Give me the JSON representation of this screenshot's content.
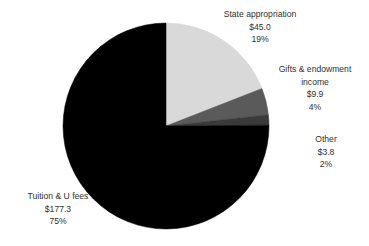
{
  "chart_data": {
    "type": "pie",
    "title": "",
    "subtitle": "",
    "xlabel": "",
    "ylabel": "",
    "legend_position": "none",
    "grid": false,
    "value_prefix": "$",
    "total_value": 236.0,
    "start_angle_deg": 0,
    "direction": "clockwise",
    "categories": [
      "State appropriation",
      "Gifts & endowment income",
      "Other",
      "Tuition & U fees"
    ],
    "values": [
      45.0,
      9.9,
      3.8,
      177.3
    ],
    "percentages": [
      19,
      4,
      2,
      75
    ],
    "colors": [
      "#d9d9d9",
      "#5a5a5a",
      "#3a3a3a",
      "#000000"
    ],
    "slices": [
      {
        "name": "State appropriation",
        "value": 45.0,
        "value_label": "$45.0",
        "percent": 19,
        "percent_label": "19%",
        "color": "#d9d9d9"
      },
      {
        "name": "Gifts & endowment income",
        "value": 9.9,
        "value_label": "$9.9",
        "percent": 4,
        "percent_label": "4%",
        "color": "#5a5a5a"
      },
      {
        "name": "Other",
        "value": 3.8,
        "value_label": "$3.8",
        "percent": 2,
        "percent_label": "2%",
        "color": "#3a3a3a"
      },
      {
        "name": "Tuition & U fees",
        "value": 177.3,
        "value_label": "$177.3",
        "percent": 75,
        "percent_label": "75%",
        "color": "#000000"
      }
    ]
  },
  "labels": {
    "state": {
      "name": "State appropriation",
      "value": "$45.0",
      "percent": "19%"
    },
    "gifts": {
      "name_line1": "Gifts & endowment",
      "name_line2": "income",
      "value": "$9.9",
      "percent": "4%"
    },
    "other": {
      "name": "Other",
      "value": "$3.8",
      "percent": "2%"
    },
    "tuition": {
      "name": "Tuition & U fees",
      "value": "$177.3",
      "percent": "75%"
    }
  },
  "geometry": {
    "center_x": 166,
    "center_y": 126,
    "radius": 103
  },
  "colors": {
    "background": "#ffffff",
    "text": "#2f2f2f",
    "slice_light": "#d9d9d9",
    "slice_medium": "#5a5a5a",
    "slice_dark": "#3a3a3a",
    "slice_black": "#000000"
  }
}
